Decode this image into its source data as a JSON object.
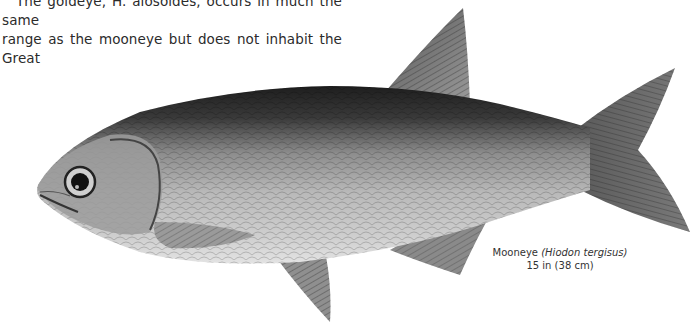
{
  "page": {
    "body_text": {
      "line1": "The goldeye, H. alosoides, occurs in much the same",
      "line2": "range as the mooneye but does not inhabit the Great"
    },
    "illustration": {
      "subject": "fish-illustration",
      "caption": {
        "common_name": "Mooneye",
        "scientific_name_open": "(",
        "scientific_name": "Hiodon tergisus",
        "scientific_name_close": ")",
        "size": "15 in (38 cm)"
      }
    },
    "colors": {
      "background": "#ffffff",
      "text": "#2b2b2b",
      "fish_dark": "#2a2a2a",
      "fish_mid": "#8a8a8a",
      "fish_light": "#d8d8d8"
    }
  }
}
